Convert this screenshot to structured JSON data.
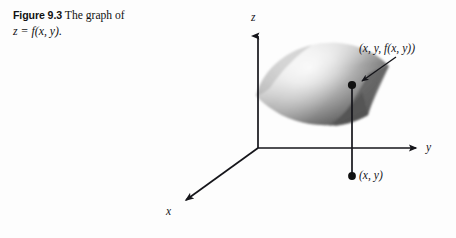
{
  "figure": {
    "number_label": "Figure 9.3",
    "caption_text": "The graph of",
    "caption_equation": "z = f(x, y).",
    "background_color": "#fdfdfd",
    "ink_color": "#15151a"
  },
  "plot": {
    "axes": [
      {
        "name": "z-axis",
        "label": "z",
        "direction": "up",
        "origin": [
          258,
          148
        ],
        "tip": [
          258,
          33
        ]
      },
      {
        "name": "y-axis",
        "label": "y",
        "direction": "right",
        "origin": [
          258,
          148
        ],
        "tip": [
          420,
          148
        ]
      },
      {
        "name": "x-axis",
        "label": "x",
        "direction": "down-left",
        "origin": [
          258,
          148
        ],
        "tip": [
          182,
          203
        ]
      }
    ],
    "origin": [
      258,
      148
    ],
    "surface": {
      "name": "graph-of-f",
      "shading": "grayscale-gradient",
      "light_tone": "#f2f2f2",
      "mid_tone": "#c4c4c4",
      "dark_tone": "#5c5c5c",
      "bounds": [
        255,
        44,
        392,
        127
      ]
    },
    "points": [
      {
        "name": "surface-point",
        "label": "(x, y, f(x, y))",
        "at": [
          352,
          85
        ],
        "label_at": [
          359,
          48
        ],
        "leader_from": [
          395,
          57
        ],
        "leader_to": [
          357,
          83
        ]
      },
      {
        "name": "base-point",
        "label": "(x, y)",
        "at": [
          352,
          176
        ],
        "label_at": [
          359,
          176
        ]
      }
    ],
    "drop_line": {
      "name": "vertical-drop-line",
      "from": [
        352,
        85
      ],
      "to": [
        352,
        176
      ]
    }
  }
}
